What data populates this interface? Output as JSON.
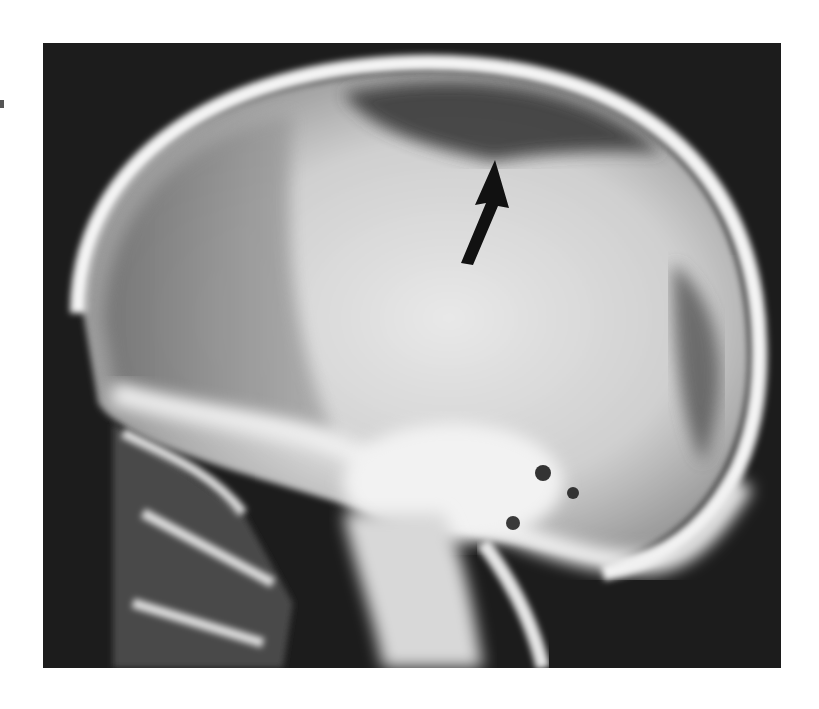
{
  "image": {
    "subject": "lateral skull radiograph",
    "description": "Lateral X-ray of a skull with a black arrow pointing to a lucent area beneath the vertex of the calvarium",
    "annotation": {
      "type": "arrow",
      "color": "#111111",
      "direction": "up-right"
    },
    "colors": {
      "background": "#1a1a1a",
      "bone": "#f2f2f2",
      "soft_tissue": "#bdbdbd",
      "page": "#ffffff"
    }
  }
}
